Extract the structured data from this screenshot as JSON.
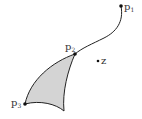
{
  "diagram": {
    "points": [
      {
        "id": "p1",
        "label": "p",
        "sub": "1",
        "x": 121,
        "y": 6
      },
      {
        "id": "p2",
        "label": "p",
        "sub": "2",
        "x": 75,
        "y": 54
      },
      {
        "id": "p3",
        "label": "p",
        "sub": "3",
        "x": 25,
        "y": 104
      },
      {
        "id": "z",
        "label": "z",
        "sub": "",
        "x": 98,
        "y": 61
      }
    ],
    "colors": {
      "stroke": "#222222",
      "fill": "#d4d4d4",
      "text": "#333333"
    }
  }
}
